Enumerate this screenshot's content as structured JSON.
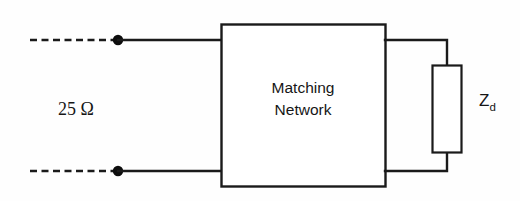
{
  "diagram": {
    "type": "circuit-schematic",
    "background_color": "#fefefe",
    "line_color": "#1a1a1a",
    "source": {
      "label": "25 Ω",
      "name": "source-impedance-label",
      "value": "25",
      "unit": "Ω"
    },
    "matching_network": {
      "label_line1": "Matching",
      "label_line2": "Network",
      "shape": "rectangle"
    },
    "load": {
      "label_main": "Z",
      "label_subscript": "d",
      "shape": "rectangle-resistor"
    },
    "terminals": {
      "top": "input-terminal-top",
      "bottom": "input-terminal-bottom",
      "count": 2
    },
    "wires": {
      "dashed_top": "dashed-lead-top",
      "dashed_bottom": "dashed-lead-bottom",
      "solid_top": "input-wire-top",
      "solid_bottom": "input-wire-bottom",
      "output_top": "output-wire-top",
      "output_bottom": "output-wire-bottom"
    }
  }
}
